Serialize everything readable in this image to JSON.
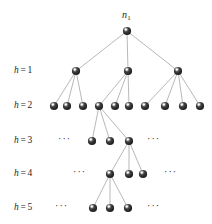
{
  "figure": {
    "title": "",
    "background_color": "#ffffff",
    "node_color": "#2d2d2d",
    "node_highlight_color": "#ffffff",
    "edge_color": "#9a9a9a",
    "text_color": "#1f1f1f"
  },
  "root": {
    "label_var": "n",
    "label_sub": "1",
    "label_text": "n1"
  },
  "levels": [
    {
      "id": "h1",
      "var": "h",
      "eq": "=",
      "value": "1",
      "text": "h = 1",
      "y": 71
    },
    {
      "id": "h2",
      "var": "h",
      "eq": "=",
      "value": "2",
      "text": "h = 2",
      "y": 106
    },
    {
      "id": "h3",
      "var": "h",
      "eq": "=",
      "value": "3",
      "text": "h = 3",
      "y": 141
    },
    {
      "id": "h4",
      "var": "h",
      "eq": "=",
      "value": "4",
      "text": "h = 4",
      "y": 174
    },
    {
      "id": "h5",
      "var": "h",
      "eq": "=",
      "value": "5",
      "text": "h = 5",
      "y": 208
    }
  ],
  "chart_data": {
    "type": "diagram",
    "diagram_kind": "tree",
    "title": "",
    "node_radius": 4.1,
    "rows": [
      {
        "depth": 0,
        "label": "root",
        "y": 31,
        "node_x": [
          127
        ]
      },
      {
        "depth": 1,
        "label": "h = 1",
        "y": 71,
        "node_x": [
          76,
          128,
          178
        ]
      },
      {
        "depth": 2,
        "label": "h = 2",
        "y": 106,
        "node_x": [
          54,
          67,
          83,
          99,
          115,
          129,
          145,
          165,
          183,
          200
        ]
      },
      {
        "depth": 3,
        "label": "h = 3",
        "y": 141,
        "node_x": [
          92,
          110,
          129
        ]
      },
      {
        "depth": 4,
        "label": "h = 4",
        "y": 174,
        "node_x": [
          110,
          129,
          143
        ]
      },
      {
        "depth": 5,
        "label": "h = 5",
        "y": 208,
        "node_x": [
          93,
          110,
          128
        ]
      }
    ],
    "edges": [
      [
        127,
        31,
        76,
        71
      ],
      [
        127,
        31,
        128,
        71
      ],
      [
        127,
        31,
        178,
        71
      ],
      [
        76,
        71,
        54,
        106
      ],
      [
        76,
        71,
        67,
        106
      ],
      [
        76,
        71,
        83,
        106
      ],
      [
        128,
        71,
        99,
        106
      ],
      [
        128,
        71,
        115,
        106
      ],
      [
        128,
        71,
        129,
        106
      ],
      [
        178,
        71,
        145,
        106
      ],
      [
        178,
        71,
        165,
        106
      ],
      [
        178,
        71,
        183,
        106
      ],
      [
        178,
        71,
        200,
        106
      ],
      [
        99,
        106,
        92,
        141
      ],
      [
        99,
        106,
        110,
        141
      ],
      [
        99,
        106,
        129,
        141
      ],
      [
        129,
        141,
        110,
        174
      ],
      [
        129,
        141,
        129,
        174
      ],
      [
        129,
        141,
        143,
        174
      ],
      [
        110,
        174,
        93,
        208
      ],
      [
        110,
        174,
        110,
        208
      ],
      [
        110,
        174,
        128,
        208
      ]
    ],
    "ellipses": [
      {
        "text": "···",
        "x": 66,
        "y": 141
      },
      {
        "text": "···",
        "x": 155,
        "y": 141
      },
      {
        "text": "···",
        "x": 81,
        "y": 174
      },
      {
        "text": "···",
        "x": 172,
        "y": 174
      },
      {
        "text": "···",
        "x": 63,
        "y": 208
      },
      {
        "text": "···",
        "x": 155,
        "y": 208
      }
    ],
    "annotations": [
      {
        "text": "n1",
        "x": 127,
        "y": 15
      }
    ],
    "xlabel": "",
    "ylabel": "",
    "grid": false,
    "legend": "none"
  }
}
